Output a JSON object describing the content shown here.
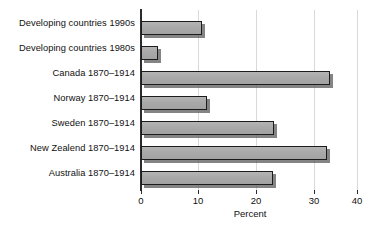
{
  "chart_data": {
    "type": "bar",
    "orientation": "horizontal",
    "title": "",
    "xlabel": "Percent",
    "ylabel": "",
    "xlim": [
      0,
      40
    ],
    "xticks": [
      0,
      10,
      20,
      30,
      40
    ],
    "xtick_labels": [
      "0",
      "10",
      "20",
      "30",
      "40"
    ],
    "grid": true,
    "grid_axis": "x",
    "legend": false,
    "categories": [
      "Developing countries 1990s",
      "Developing countries 1980s",
      "Canada 1870–1914",
      "Norway 1870–1914",
      "Sweden 1870–1914",
      "New Zealend 1870–1914",
      "Australia 1870–1914"
    ],
    "values": [
      11.3,
      3.1,
      35.0,
      12.3,
      24.6,
      34.5,
      24.4
    ],
    "bar_color": "#ababab",
    "bar_edge_color": "#1c1c1c",
    "shadow_color": "#555555",
    "grid_color": "#d9d9d9",
    "axis_color": "#2b2b2b",
    "background": "#ffffff"
  }
}
